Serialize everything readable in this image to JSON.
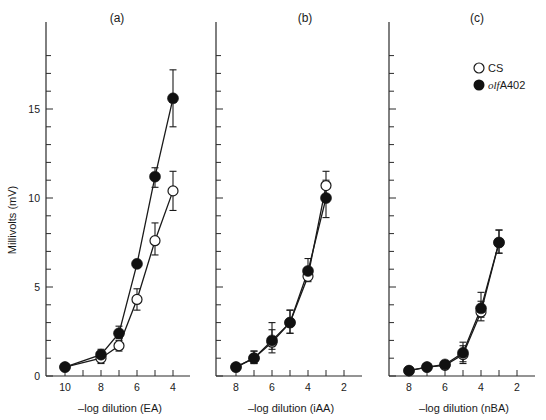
{
  "chart_data": [
    {
      "type": "line",
      "panel_label": "(a)",
      "title": "(a)",
      "xlabel": "–log dilution (EA)",
      "ylabel": "Millivolts (mV)",
      "x_reversed": true,
      "xlim": [
        10.6,
        3.4
      ],
      "ylim": [
        0,
        19
      ],
      "xticks": [
        10,
        9,
        8,
        7,
        6,
        5,
        4
      ],
      "xtick_labels": [
        "10",
        "",
        "8",
        "",
        "6",
        "",
        "4"
      ],
      "yticks_major": [
        0,
        5,
        10,
        15
      ],
      "yticks_minor_step": 1,
      "grid": false,
      "series": [
        {
          "name": "CS",
          "marker": "open-circle",
          "x": [
            10,
            8,
            7,
            6,
            5,
            4
          ],
          "y": [
            0.5,
            1.0,
            1.7,
            4.3,
            7.6,
            10.4
          ],
          "err_low": [
            0.4,
            0.7,
            1.4,
            3.7,
            6.8,
            9.3
          ],
          "err_high": [
            0.6,
            1.3,
            2.0,
            4.9,
            8.6,
            11.5
          ]
        },
        {
          "name": "olfA402",
          "marker": "filled-circle",
          "x": [
            10,
            8,
            7,
            6,
            5,
            4
          ],
          "y": [
            0.5,
            1.2,
            2.4,
            6.3,
            11.2,
            15.6
          ],
          "err_low": [
            0.4,
            0.9,
            2.1,
            6.1,
            10.6,
            14.0
          ],
          "err_high": [
            0.6,
            1.5,
            2.8,
            6.5,
            11.7,
            17.2
          ]
        }
      ]
    },
    {
      "type": "line",
      "panel_label": "(b)",
      "title": "(b)",
      "xlabel": "–log dilution (iAA)",
      "ylabel": "",
      "x_reversed": true,
      "xlim": [
        8.6,
        1.4
      ],
      "ylim": [
        0,
        19
      ],
      "xticks": [
        8,
        7,
        6,
        5,
        4,
        3,
        2
      ],
      "xtick_labels": [
        "8",
        "",
        "6",
        "",
        "4",
        "",
        "2"
      ],
      "yticks_major": [
        0,
        5,
        10,
        15
      ],
      "yticks_minor_step": 1,
      "grid": false,
      "series": [
        {
          "name": "CS",
          "marker": "open-circle",
          "x": [
            8,
            7,
            6,
            5,
            4,
            3
          ],
          "y": [
            0.5,
            1.0,
            1.9,
            3.0,
            5.6,
            10.7
          ],
          "err_low": [
            0.3,
            0.7,
            1.3,
            2.4,
            5.3,
            9.8
          ],
          "err_high": [
            0.7,
            1.4,
            2.6,
            3.7,
            6.0,
            11.5
          ]
        },
        {
          "name": "olfA402",
          "marker": "filled-circle",
          "x": [
            8,
            7,
            6,
            5,
            4,
            3
          ],
          "y": [
            0.5,
            1.0,
            2.0,
            3.0,
            5.9,
            10.0
          ],
          "err_low": [
            0.3,
            0.7,
            1.5,
            2.4,
            5.5,
            8.9
          ],
          "err_high": [
            0.7,
            1.4,
            3.0,
            3.7,
            6.6,
            11.0
          ]
        }
      ]
    },
    {
      "type": "line",
      "panel_label": "(c)",
      "title": "(c)",
      "xlabel": "–log dilution (nBA)",
      "ylabel": "",
      "x_reversed": true,
      "xlim": [
        8.6,
        1.4
      ],
      "ylim": [
        0,
        19
      ],
      "xticks": [
        8,
        7,
        6,
        5,
        4,
        3,
        2
      ],
      "xtick_labels": [
        "8",
        "",
        "6",
        "",
        "4",
        "",
        "2"
      ],
      "yticks_major": [
        0,
        5,
        10,
        15
      ],
      "yticks_minor_step": 1,
      "grid": false,
      "legend": {
        "position": "upper-right",
        "entries": [
          {
            "label": "CS",
            "marker": "open-circle"
          },
          {
            "label_italic": "olf",
            "label_rest": "A402",
            "marker": "filled-circle"
          }
        ]
      },
      "series": [
        {
          "name": "CS",
          "marker": "open-circle",
          "x": [
            8,
            7,
            6,
            5,
            4,
            3
          ],
          "y": [
            0.3,
            0.5,
            0.6,
            1.2,
            3.6,
            7.5
          ],
          "err_low": [
            0.2,
            0.4,
            0.5,
            0.7,
            3.1,
            6.9
          ],
          "err_high": [
            0.4,
            0.6,
            0.8,
            1.7,
            4.2,
            8.2
          ]
        },
        {
          "name": "olfA402",
          "marker": "filled-circle",
          "x": [
            8,
            7,
            6,
            5,
            4,
            3
          ],
          "y": [
            0.3,
            0.5,
            0.65,
            1.3,
            3.8,
            7.5
          ],
          "err_low": [
            0.2,
            0.4,
            0.5,
            0.8,
            3.3,
            6.9
          ],
          "err_high": [
            0.4,
            0.6,
            0.8,
            1.9,
            4.7,
            8.2
          ]
        }
      ]
    }
  ],
  "figure": {
    "ylabel": "Millivolts (mV)",
    "panel_labels": [
      "(a)",
      "(b)",
      "(c)"
    ],
    "legend": {
      "cs_label": "CS",
      "mutant_italic": "olf",
      "mutant_rest": "A402"
    }
  }
}
